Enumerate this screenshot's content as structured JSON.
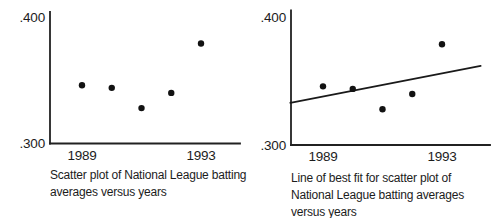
{
  "page": {
    "background": "#ffffff",
    "ink_color": "#1f1f1f",
    "point_color": "#121212"
  },
  "chart_data": [
    {
      "id": "scatter-plot",
      "type": "scatter",
      "caption": "Scatter plot of National League batting averages versus years",
      "x": [
        1989,
        1990,
        1991,
        1992,
        1993
      ],
      "y": [
        0.346,
        0.344,
        0.328,
        0.34,
        0.379
      ],
      "xtick_values": [
        1989,
        1993
      ],
      "xtick_labels": [
        "1989",
        "1993"
      ],
      "ytick_values": [
        0.3,
        0.4
      ],
      "ytick_labels": [
        ".300",
        ".400"
      ],
      "xlim": [
        1987.9,
        1994.3
      ],
      "ylim": [
        0.3,
        0.4
      ],
      "grid": false,
      "legend": false
    },
    {
      "id": "best-fit-plot",
      "type": "scatter",
      "caption": "Line of best fit for scatter plot of National League batting averages versus years",
      "x": [
        1989,
        1990,
        1991,
        1992,
        1993
      ],
      "y": [
        0.346,
        0.344,
        0.328,
        0.34,
        0.379
      ],
      "best_fit_line": {
        "x": [
          1987.9,
          1994.3
        ],
        "y": [
          0.333,
          0.362
        ]
      },
      "xtick_values": [
        1989,
        1993
      ],
      "xtick_labels": [
        "1989",
        "1993"
      ],
      "ytick_values": [
        0.3,
        0.4
      ],
      "ytick_labels": [
        ".300",
        ".400"
      ],
      "xlim": [
        1987.9,
        1994.3
      ],
      "ylim": [
        0.3,
        0.4
      ],
      "grid": false,
      "legend": false
    }
  ]
}
